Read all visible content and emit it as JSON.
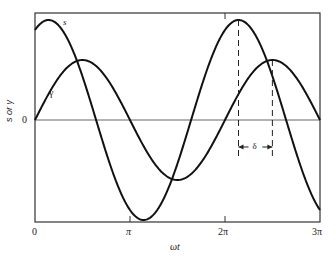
{
  "chart_data": {
    "type": "line",
    "title": "",
    "xlabel": "ωt",
    "ylabel": "s or γ",
    "xlim": [
      0,
      9.4248
    ],
    "ylim": [
      -1.06,
      1.0
    ],
    "x_ticks": [
      {
        "value": 0,
        "label": "0"
      },
      {
        "value": 3.1416,
        "label": "π"
      },
      {
        "value": 6.2832,
        "label": "2π"
      },
      {
        "value": 9.4248,
        "label": "3π"
      }
    ],
    "y_ticks": [
      {
        "value": 0,
        "label": "0"
      }
    ],
    "grid": false,
    "legend": "none (curves labeled inline)",
    "series": [
      {
        "name": "s",
        "label": "s",
        "amplitude": 1.0,
        "phase_lead_rad": 0.45,
        "formula": "s = cos(ωt - 0.45)",
        "key_points": [
          {
            "x": 0.45,
            "y": 1.0
          },
          {
            "x": 3.59,
            "y": -1.0
          },
          {
            "x": 6.73,
            "y": 1.0
          }
        ]
      },
      {
        "name": "γ",
        "label": "γ",
        "amplitude": 0.6,
        "phase_lead_rad": 1.57,
        "formula": "γ = 0.6·cos(ωt - 1.57)",
        "key_points": [
          {
            "x": 1.57,
            "y": 0.6
          },
          {
            "x": 4.71,
            "y": -0.6
          },
          {
            "x": 7.85,
            "y": 0.6
          }
        ]
      }
    ],
    "annotations": [
      {
        "type": "phase-lag",
        "label": "δ",
        "from_x": 6.73,
        "to_x": 7.85,
        "description": "dashed verticals at peaks of s and γ with double arrow marking lag δ"
      }
    ]
  },
  "labels": {
    "s_curve": "s",
    "gamma_curve": "γ",
    "zero": "0",
    "x_zero": "0",
    "x_pi": "π",
    "x_2pi": "2π",
    "x_3pi": "3π",
    "xlabel": "ωt",
    "ylabel": "s or γ",
    "delta": "δ"
  }
}
